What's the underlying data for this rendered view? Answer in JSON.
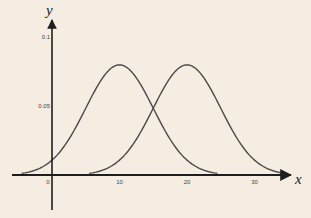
{
  "chart_data": {
    "type": "line",
    "title": "",
    "xlabel": "x",
    "ylabel": "y",
    "xlim": [
      -6,
      36
    ],
    "ylim": [
      -0.025,
      0.115
    ],
    "grid": false,
    "legend": null,
    "x_ticks": [
      0,
      10,
      20,
      30
    ],
    "x_tick_labels": [
      "0",
      "10",
      "20",
      "30"
    ],
    "y_ticks": [
      0.05,
      0.1
    ],
    "y_tick_labels": [
      "0.05",
      "0.1"
    ],
    "series": [
      {
        "name": "normal curve (mean 10)",
        "distribution": "normal",
        "mean": 10,
        "sd": 5,
        "x_range": [
          -4.5,
          24.5
        ],
        "peak": 0.0798
      },
      {
        "name": "normal curve (mean 20)",
        "distribution": "normal",
        "mean": 20,
        "sd": 5,
        "x_range": [
          5.5,
          34.5
        ],
        "peak": 0.0798
      }
    ],
    "annotations": [
      {
        "text": "curves intersect",
        "x": 15,
        "y": 0.0484
      }
    ]
  },
  "colors": {
    "background": "#f6ede2",
    "axis": "#1e1e1e",
    "curve": "#4a4a4a"
  }
}
